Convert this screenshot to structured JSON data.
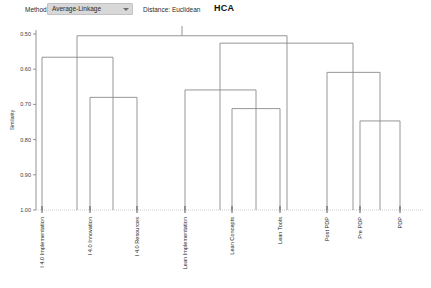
{
  "toolbar": {
    "method_label": "Method:",
    "method_value": "Average-Linkage",
    "method_options": [
      "Average-Linkage"
    ],
    "distance_label": "Distance: Euclidean",
    "dropdown_icon": "chevron-down-icon"
  },
  "chart_data": {
    "type": "dendrogram",
    "title": "HCA",
    "xlabel": "",
    "ylabel": "Similarity",
    "ylim": [
      0.5,
      1.0
    ],
    "yticks": [
      "0.50",
      "0.60",
      "0.70",
      "0.80",
      "0.90",
      "1.00"
    ],
    "ytick_values": [
      0.5,
      0.6,
      0.7,
      0.8,
      0.9,
      1.0
    ],
    "y_inverted": true,
    "grid": false,
    "leaves": [
      "I 4.0 Implementation",
      "I 4.0 Innovation",
      "I 4.0 Resources",
      "Lean Implementation",
      "Lean Concepts",
      "Lean Tools",
      "Post PDP",
      "Pre PDP",
      "PDP"
    ],
    "leaf_x": [
      42,
      90,
      137,
      185,
      232,
      280,
      327,
      360,
      400
    ],
    "merges": [
      {
        "name": "lean-concepts-tools",
        "left_x": 232,
        "right_x": 280,
        "height": 0.712
      },
      {
        "name": "lean-cluster",
        "left_x": 185,
        "right_x": 256,
        "height": 0.659
      },
      {
        "name": "pre-pdp-pdp",
        "left_x": 360,
        "right_x": 400,
        "height": 0.747
      },
      {
        "name": "pdp-cluster",
        "left_x": 327,
        "right_x": 380,
        "height": 0.609
      },
      {
        "name": "i40-innov-resources",
        "left_x": 90,
        "right_x": 137,
        "height": 0.68
      },
      {
        "name": "i40-cluster",
        "left_x": 42,
        "right_x": 113,
        "height": 0.566
      },
      {
        "name": "lean-pdp-cluster",
        "left_x": 220,
        "right_x": 353,
        "height": 0.526
      },
      {
        "name": "root",
        "left_x": 77,
        "right_x": 287,
        "height": 0.505
      }
    ],
    "footnote": ""
  }
}
